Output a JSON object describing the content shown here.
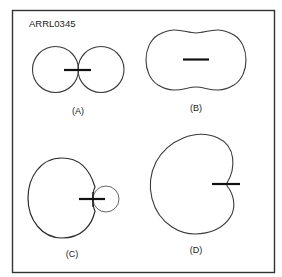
{
  "figure": {
    "id_label": "ARRL0345",
    "panels": [
      {
        "key": "A",
        "caption": "(A)",
        "description": "Figure-eight (bidirectional) pattern"
      },
      {
        "key": "B",
        "caption": "(B)",
        "description": "Peanut-shaped pattern"
      },
      {
        "key": "C",
        "caption": "(C)",
        "description": "Large main lobe with small back lobe"
      },
      {
        "key": "D",
        "caption": "(D)",
        "description": "Cardioid pattern"
      }
    ]
  },
  "colors": {
    "frame": "#333333",
    "pattern": "#3a3a3a",
    "element": "#111111",
    "background": "#ffffff"
  }
}
